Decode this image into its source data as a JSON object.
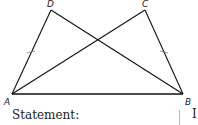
{
  "figure": {
    "vertices": [
      {
        "name": "A"
      },
      {
        "name": "B"
      },
      {
        "name": "C"
      },
      {
        "name": "D"
      }
    ],
    "segments": [
      "AB",
      "AD",
      "BC",
      "AC",
      "BD"
    ],
    "congruent_marks": [
      "AD",
      "BC"
    ]
  },
  "labels": {
    "A": "A",
    "B": "B",
    "C": "C",
    "D": "D"
  },
  "statement_label": "Statement:",
  "trailing_text": "I"
}
